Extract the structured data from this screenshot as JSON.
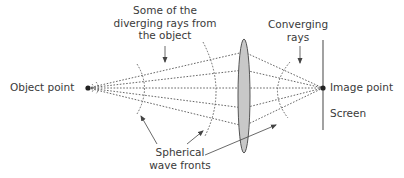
{
  "labels": {
    "object_point": "Object point",
    "image_point": "Image point",
    "screen": "Screen",
    "diverging_rays": [
      "Some of the",
      "diverging rays from",
      "the object"
    ],
    "converging_rays": [
      "Converging",
      "rays"
    ],
    "wave_fronts": [
      "Spherical",
      "wave fronts"
    ]
  },
  "colors": {
    "line": "#555555",
    "lens_fill": "#c8c8c8",
    "lens_stroke": "#555555",
    "text": "#3a3a3a",
    "background": "#ffffff"
  },
  "geometry": {
    "object_point": [
      88,
      88
    ],
    "image_point": [
      323,
      88
    ],
    "lens_center": [
      244,
      96
    ],
    "lens_radii": [
      6,
      57
    ],
    "screen_x": 323,
    "screen_y_range": [
      40,
      130
    ],
    "ray_lens_y": [
      52,
      70,
      88,
      108,
      126
    ]
  }
}
